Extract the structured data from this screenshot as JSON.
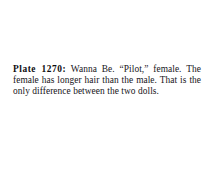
{
  "page": {
    "background_color": "#ffffff",
    "text_color": "#17151a"
  },
  "caption": {
    "plate_label": "Plate 1270:",
    "body_text": " Wanna Be. “Pilot,” female. The female has longer hair than the male. That is the only difference between the two dolls.",
    "full_text": "Plate 1270: Wanna Be. “Pilot,” female. The female has longer hair than the male. That is the only difference between the two dolls.",
    "lines": [
      "Plate 1270: Wanna Be. “Pilot,”",
      "female. The female has longer hair",
      "than the male. That is the only differ-",
      "ence between the two dolls."
    ],
    "plate_number": "1270",
    "subject_name": "Wanna Be",
    "variant_name": "“Pilot,”",
    "gender": "female"
  }
}
